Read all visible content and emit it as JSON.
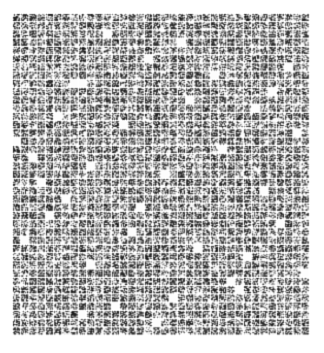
{
  "image": {
    "title": "Scanned micro-pattern patch array",
    "width": 324,
    "height": 353,
    "background_color": "#ffffff"
  },
  "chart_data": {
    "type": "heatmap",
    "subtitle": "",
    "xlabel": "",
    "ylabel": "",
    "grid": false,
    "legend": "none",
    "columns": 36,
    "rows": 39,
    "cell_pitch_px": 8.25,
    "patch_size_px": 6.6,
    "gutter_px": 1.65,
    "origin_x_px": 13,
    "origin_y_px": 14,
    "grid_right_px": 310,
    "grid_bottom_px": 336,
    "margins_px": {
      "left": 13,
      "top": 14,
      "right": 14,
      "bottom": 17
    },
    "speckle": {
      "sub_pixels_per_patch": 7,
      "ink_color": "#1a1a1a",
      "paper_color": "#fdfdfd",
      "mean_ink_fraction": 0.52,
      "ink_fraction_range": [
        0.3,
        0.72
      ]
    },
    "blank_patch_fraction": 0.022,
    "row_mean_density": [
      0.55,
      0.57,
      0.54,
      0.58,
      0.53,
      0.56,
      0.52,
      0.57,
      0.49,
      0.55,
      0.56,
      0.53,
      0.57,
      0.54,
      0.58,
      0.55,
      0.52,
      0.56,
      0.54,
      0.57,
      0.53,
      0.55,
      0.58,
      0.52,
      0.56,
      0.54,
      0.57,
      0.53,
      0.55,
      0.56,
      0.52,
      0.58,
      0.54,
      0.55,
      0.57,
      0.53,
      0.56,
      0.54,
      0.55
    ],
    "column_mean_density": [
      0.56,
      0.54,
      0.57,
      0.53,
      0.55,
      0.58,
      0.52,
      0.56,
      0.54,
      0.57,
      0.53,
      0.55,
      0.56,
      0.52,
      0.58,
      0.54,
      0.55,
      0.57,
      0.53,
      0.56,
      0.54,
      0.55,
      0.52,
      0.57,
      0.53,
      0.56,
      0.58,
      0.54,
      0.52,
      0.55,
      0.57,
      0.53,
      0.5,
      0.54,
      0.51,
      0.49
    ],
    "blank_cells": [
      [
        8,
        7
      ],
      [
        8,
        8
      ],
      [
        3,
        20
      ],
      [
        12,
        5
      ],
      [
        17,
        2
      ],
      [
        21,
        30
      ],
      [
        26,
        14
      ],
      [
        30,
        9
      ],
      [
        33,
        27
      ],
      [
        35,
        12
      ],
      [
        6,
        33
      ],
      [
        14,
        34
      ],
      [
        19,
        18
      ],
      [
        24,
        4
      ],
      [
        28,
        22
      ],
      [
        11,
        29
      ],
      [
        2,
        11
      ],
      [
        37,
        17
      ],
      [
        16,
        25
      ],
      [
        9,
        31
      ],
      [
        22,
        6
      ],
      [
        31,
        35
      ],
      [
        5,
        16
      ],
      [
        13,
        13
      ],
      [
        27,
        1
      ],
      [
        34,
        19
      ],
      [
        18,
        9
      ],
      [
        7,
        24
      ],
      [
        25,
        32
      ],
      [
        20,
        3
      ],
      [
        29,
        28
      ],
      [
        36,
        8
      ],
      [
        10,
        21
      ],
      [
        15,
        0
      ],
      [
        23,
        15
      ],
      [
        32,
        26
      ]
    ]
  }
}
